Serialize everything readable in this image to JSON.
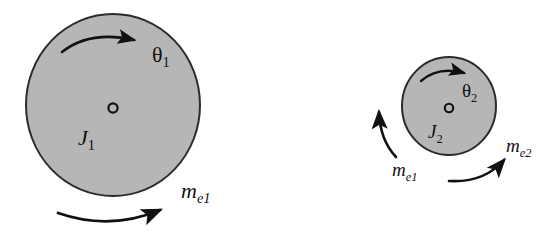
{
  "figure": {
    "width": 560,
    "height": 237,
    "background_color": "#ffffff"
  },
  "style": {
    "disc_fill": "#b6b6b6",
    "disc_stroke": "#2b2b2b",
    "line_color": "#111111",
    "center_marker_stroke": "#111111"
  },
  "rotors": [
    {
      "id": "rotor-1",
      "inertia_label": "J",
      "inertia_sub": "1",
      "angle_label": "θ",
      "angle_sub": "1",
      "unbalance_label": "m",
      "unbalance_sub": "e1",
      "center_x": 113,
      "center_y": 105,
      "radius": 87
    },
    {
      "id": "rotor-2",
      "inertia_label": "J",
      "inertia_sub": "2",
      "angle_label": "θ",
      "angle_sub": "2",
      "unbalance_label": "m",
      "unbalance_sub": "e2",
      "coupled_label": "m",
      "coupled_sub": "e1",
      "center_x": 449,
      "center_y": 106,
      "radius": 47
    }
  ],
  "labels": {
    "theta1_sym": "θ",
    "theta1_sub": "1",
    "j1_sym": "J",
    "j1_sub": "1",
    "me1_left_sym": "m",
    "me1_left_sub": "e1",
    "theta2_sym": "θ",
    "theta2_sub": "2",
    "j2_sym": "J",
    "j2_sub": "2",
    "me1_right_sym": "m",
    "me1_right_sub": "e1",
    "me2_sym": "m",
    "me2_sub": "e2"
  },
  "arrows": [
    {
      "name": "rotation-arrow-rotor-1",
      "kind": "curved-arc",
      "direction": "clockwise",
      "location": "inside-top-of-rotor-1"
    },
    {
      "name": "force-arrow-rotor-1",
      "kind": "curved-arc",
      "direction": "right-up",
      "location": "below-rotor-1"
    },
    {
      "name": "rotation-arrow-rotor-2",
      "kind": "curved-arc",
      "direction": "clockwise",
      "location": "inside-top-of-rotor-2"
    },
    {
      "name": "force-arrow-me1-rotor-2",
      "kind": "curved-arc",
      "direction": "up",
      "location": "left-of-rotor-2"
    },
    {
      "name": "force-arrow-me2-rotor-2",
      "kind": "curved-arc",
      "direction": "right-up",
      "location": "lower-right-of-rotor-2"
    }
  ]
}
